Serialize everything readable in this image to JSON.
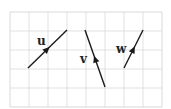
{
  "diagram": {
    "grid": {
      "x0": 10,
      "y0": 12,
      "cell": 19,
      "cols": 8,
      "rows": 5,
      "line_color": "#d9d9d9",
      "border_color": "#cfcfcf"
    },
    "vectors": [
      {
        "label": "u",
        "from": [
          28,
          68
        ],
        "to": [
          67,
          30
        ],
        "arrow_at": 0.5,
        "label_pos": [
          37,
          45
        ]
      },
      {
        "label": "v",
        "from": [
          105,
          87
        ],
        "to": [
          85,
          30
        ],
        "arrow_at": 0.5,
        "label_pos": [
          80,
          63
        ]
      },
      {
        "label": "w",
        "from": [
          124,
          68
        ],
        "to": [
          143,
          30
        ],
        "arrow_at": 0.5,
        "label_pos": [
          116,
          53
        ]
      }
    ],
    "stroke_color": "#1a1a1a"
  }
}
